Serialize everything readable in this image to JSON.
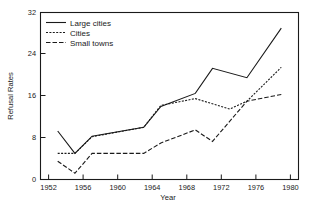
{
  "chart_data": {
    "type": "line",
    "title": "",
    "xlabel": "Year",
    "ylabel": "Refusal Rates",
    "xlim": [
      1951,
      1981
    ],
    "ylim": [
      0,
      32
    ],
    "xticks": [
      1952,
      1956,
      1960,
      1964,
      1968,
      1972,
      1976,
      1980
    ],
    "yticks": [
      0,
      8,
      16,
      24,
      32
    ],
    "grid": false,
    "legend_position": "top-left",
    "series": [
      {
        "name": "Large cities",
        "style": "solid",
        "color": "#1a1a1a",
        "x": [
          1953,
          1955,
          1957,
          1963,
          1965,
          1969,
          1971,
          1975,
          1979
        ],
        "values": [
          9.3,
          5.0,
          8.3,
          10.0,
          14.0,
          16.5,
          21.3,
          19.5,
          29.0
        ]
      },
      {
        "name": "Cities",
        "style": "dotted",
        "color": "#1a1a1a",
        "x": [
          1953,
          1955,
          1957,
          1963,
          1965,
          1969,
          1973,
          1975,
          1979
        ],
        "values": [
          5.0,
          5.0,
          8.2,
          10.0,
          14.2,
          15.5,
          13.5,
          15.0,
          21.5
        ]
      },
      {
        "name": "Small towns",
        "style": "dashed",
        "color": "#1a1a1a",
        "x": [
          1953,
          1955,
          1957,
          1963,
          1965,
          1969,
          1971,
          1975,
          1979
        ],
        "values": [
          3.5,
          1.2,
          5.0,
          5.0,
          7.0,
          9.5,
          7.3,
          15.0,
          16.3
        ]
      }
    ]
  },
  "axes": {
    "ylabel": "Refusal Rates",
    "xlabel": "Year",
    "ytick_labels": [
      "0",
      "8",
      "16",
      "24",
      "32"
    ],
    "xtick_labels": [
      "1952",
      "1956",
      "1960",
      "1964",
      "1968",
      "1972",
      "1976",
      "1980"
    ]
  },
  "legend": {
    "entries": [
      {
        "label": "Large cities",
        "style": "solid"
      },
      {
        "label": "Cities",
        "style": "dotted"
      },
      {
        "label": "Small towns",
        "style": "dashed"
      }
    ]
  },
  "caption": {
    "text": ""
  }
}
